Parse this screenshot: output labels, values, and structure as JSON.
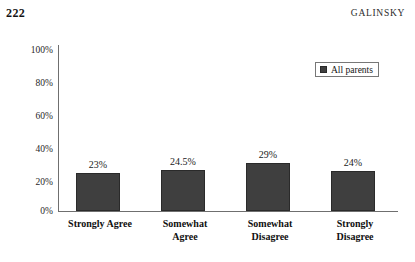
{
  "page": {
    "folio": "222",
    "running_title": "GALINSKY"
  },
  "legend": {
    "position": "top-right",
    "entries": [
      {
        "label": "All parents",
        "color": "#3f3f3f",
        "marker": "square"
      }
    ]
  },
  "axes": {
    "y_ticks": [
      "100%",
      "80%",
      "60%",
      "40%",
      "20%",
      "0%"
    ],
    "y_min": 0,
    "y_max": 100,
    "y_step": 20,
    "grid": false
  },
  "chart_data": {
    "type": "bar",
    "title": "",
    "subtitle": "",
    "xlabel": "",
    "ylabel": "",
    "ylim": [
      0,
      100
    ],
    "ytick_labels": [
      "0%",
      "20%",
      "40%",
      "60%",
      "80%",
      "100%"
    ],
    "grid": false,
    "legend_position": "top-right",
    "categories": [
      "Strongly Agree",
      "Somewhat Agree",
      "Somewhat Disagree",
      "Strongly Disagree"
    ],
    "category_lines": [
      [
        "Strongly Agree"
      ],
      [
        "Somewhat",
        "Agree"
      ],
      [
        "Somewhat",
        "Disagree"
      ],
      [
        "Strongly",
        "Disagree"
      ]
    ],
    "series": [
      {
        "name": "All parents",
        "color": "#3f3f3f",
        "values": [
          23,
          24.5,
          29,
          24
        ],
        "data_labels": [
          "23%",
          "24.5%",
          "29%",
          "24%"
        ]
      }
    ]
  }
}
